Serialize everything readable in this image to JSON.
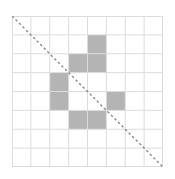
{
  "grid": {
    "rows": 8,
    "cols": 8,
    "filled_cells": [
      [
        1,
        4
      ],
      [
        2,
        3
      ],
      [
        2,
        4
      ],
      [
        3,
        2
      ],
      [
        4,
        2
      ],
      [
        4,
        5
      ],
      [
        5,
        3
      ],
      [
        5,
        4
      ]
    ]
  },
  "diagonal": {
    "from": "top-left",
    "to": "bottom-right",
    "style": "dashed"
  },
  "colors": {
    "background": "#ffffff",
    "grid_line": "#dcdcdc",
    "filled": "#b4b4b4",
    "diagonal": "#8a8a8a"
  }
}
